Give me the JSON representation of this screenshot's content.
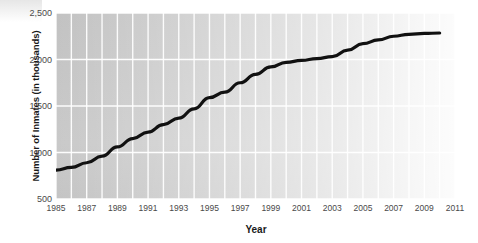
{
  "chart_data": {
    "type": "line",
    "title": "",
    "xlabel": "Year",
    "ylabel": "Number of Inmates (in thousands)",
    "xlim": [
      1985,
      2011
    ],
    "ylim": [
      500,
      2500
    ],
    "grid": true,
    "legend_position": "none",
    "y_ticks": [
      "2,500",
      "2,000",
      "1,500",
      "1,000",
      "500"
    ],
    "y_tick_values": [
      2500,
      2000,
      1500,
      1000,
      500
    ],
    "x_ticks": [
      "1985",
      "1987",
      "1989",
      "1991",
      "1993",
      "1995",
      "1997",
      "1999",
      "2001",
      "2003",
      "2005",
      "2007",
      "2009",
      "2011"
    ],
    "x_tick_values": [
      1985,
      1987,
      1989,
      1991,
      1993,
      1995,
      1997,
      1999,
      2001,
      2003,
      2005,
      2007,
      2009,
      2011
    ],
    "series": [
      {
        "name": "Number of Inmates",
        "color": "#111111",
        "x": [
          1985,
          1986,
          1987,
          1988,
          1989,
          1990,
          1991,
          1992,
          1993,
          1994,
          1995,
          1996,
          1997,
          1998,
          1999,
          2000,
          2001,
          2002,
          2003,
          2004,
          2005,
          2006,
          2007,
          2008,
          2009,
          2010
        ],
        "values": [
          810,
          840,
          890,
          960,
          1060,
          1150,
          1220,
          1300,
          1370,
          1470,
          1590,
          1650,
          1750,
          1840,
          1920,
          1970,
          1990,
          2010,
          2030,
          2100,
          2170,
          2210,
          2250,
          2270,
          2280,
          2285
        ]
      }
    ]
  },
  "axes": {
    "y_title": "Number of Inmates (in thousands)",
    "x_title": "Year"
  }
}
